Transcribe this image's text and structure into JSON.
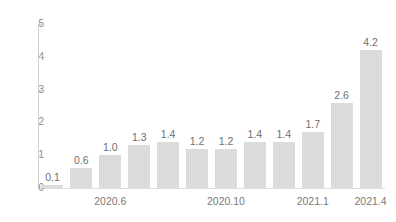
{
  "chart_data": {
    "type": "bar",
    "title": "",
    "subtitle": "",
    "xlabel": "",
    "ylabel": "",
    "ylim": [
      0,
      5
    ],
    "y_ticks": [
      "0",
      "1",
      "2",
      "3",
      "4",
      "5"
    ],
    "y_tick_values": [
      0,
      1,
      2,
      3,
      4,
      5
    ],
    "grid": false,
    "legend": null,
    "bar_color": "#d9d9d9",
    "axis_color": "#d0d0d0",
    "label_color": "#6f6f6f",
    "categories": [
      "1",
      "2",
      "3",
      "4",
      "5",
      "6",
      "7",
      "8",
      "9",
      "10",
      "11",
      "12"
    ],
    "values": [
      0.1,
      0.6,
      1.0,
      1.3,
      1.4,
      1.2,
      1.2,
      1.4,
      1.4,
      1.7,
      2.6,
      4.2
    ],
    "value_labels": [
      "0.1",
      "0.6",
      "1.0",
      "1.3",
      "1.4",
      "1.2",
      "1.2",
      "1.4",
      "1.4",
      "1.7",
      "2.6",
      "4.2"
    ],
    "x_tick_labels": [
      {
        "text": "2020.6",
        "bar_index": 2
      },
      {
        "text": "2020.10",
        "bar_index": 6
      },
      {
        "text": "2021.1",
        "bar_index": 9
      },
      {
        "text": "2021.4",
        "bar_index": 11
      }
    ]
  }
}
